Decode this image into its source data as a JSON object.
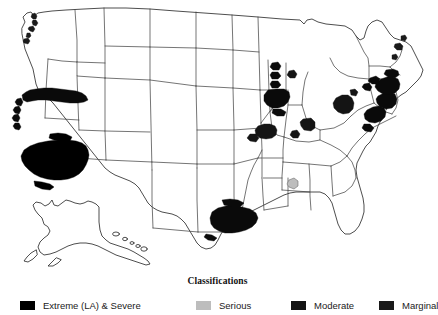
{
  "figure": {
    "background_color": "#ffffff",
    "outline_color": "#3a3a3a"
  },
  "legend": {
    "title": "Classifications",
    "entries": [
      {
        "label": "Extreme (LA) & Severe",
        "color": "#000000",
        "swatch_name": "extreme-severe-swatch"
      },
      {
        "label": "Serious",
        "color": "#bdbdbd",
        "swatch_name": "serious-swatch"
      },
      {
        "label": "Moderate",
        "color": "#141414",
        "swatch_name": "moderate-swatch"
      },
      {
        "label": "Marginal",
        "color": "#1a1a1a",
        "swatch_name": "marginal-swatch"
      }
    ]
  },
  "map": {
    "regions_shown": [
      "Continental United States",
      "Alaska inset",
      "Hawaii inset"
    ],
    "shaded_areas": [
      {
        "name": "Puget Sound, WA",
        "classification": "Marginal"
      },
      {
        "name": "Portland, OR",
        "classification": "Marginal"
      },
      {
        "name": "San Francisco Bay Area, CA",
        "classification": "Severe"
      },
      {
        "name": "Southern California (LA)",
        "classification": "Extreme (LA) & Severe"
      },
      {
        "name": "Houston-Beaumont, TX",
        "classification": "Severe"
      },
      {
        "name": "Milwaukee, WI",
        "classification": "Severe"
      },
      {
        "name": "Chicago, IL",
        "classification": "Severe"
      },
      {
        "name": "Muskegon, MI",
        "classification": "Moderate"
      },
      {
        "name": "St. Louis, MO",
        "classification": "Moderate"
      },
      {
        "name": "Louisville, KY",
        "classification": "Moderate"
      },
      {
        "name": "Cincinnati-Dayton, OH",
        "classification": "Moderate"
      },
      {
        "name": "Pittsburgh, PA",
        "classification": "Moderate"
      },
      {
        "name": "Birmingham, AL",
        "classification": "Serious"
      },
      {
        "name": "Baltimore-Washington, MD",
        "classification": "Severe"
      },
      {
        "name": "Philadelphia, PA",
        "classification": "Severe"
      },
      {
        "name": "New York-New Jersey",
        "classification": "Severe"
      },
      {
        "name": "Connecticut shoreline",
        "classification": "Severe"
      },
      {
        "name": "Portsmouth, NH",
        "classification": "Marginal"
      },
      {
        "name": "Portland, ME",
        "classification": "Marginal"
      }
    ]
  }
}
